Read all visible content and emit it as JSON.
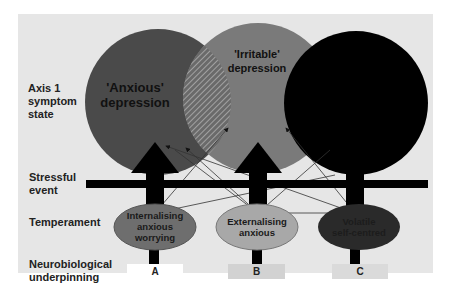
{
  "diagram": {
    "row_labels": {
      "axis1": "Axis 1 symptom state",
      "axis1_lines": [
        "Axis 1",
        "symptom",
        "state"
      ],
      "stress_lines": [
        "Stressful",
        "event"
      ],
      "temperament": "Temperament",
      "neuro_lines": [
        "Neurobiological",
        "underpinning"
      ]
    },
    "circles": [
      {
        "id": "anxious",
        "label_lines": [
          "'Anxious'",
          "depression"
        ],
        "color": "#4a4a4a"
      },
      {
        "id": "irritable",
        "label_lines": [
          "'Irritable'",
          "depression"
        ],
        "color": "#7a7a7a"
      },
      {
        "id": "third",
        "label_lines": [],
        "color": "#000000"
      }
    ],
    "temperaments": [
      {
        "id": "A",
        "label_lines": [
          "Internalising",
          "anxious",
          "worrying"
        ],
        "color": "#6e6e6e"
      },
      {
        "id": "B",
        "label_lines": [
          "Externalising",
          "anxious"
        ],
        "color": "#a8a8a8"
      },
      {
        "id": "C",
        "label_lines": [
          "Volatile",
          "self-centred"
        ],
        "color": "#2a2a2a"
      }
    ],
    "underpinnings": [
      {
        "label": "A",
        "color": "#ffffff"
      },
      {
        "label": "B",
        "color": "#d2d2d2"
      },
      {
        "label": "C",
        "color": "#dadada"
      }
    ]
  }
}
